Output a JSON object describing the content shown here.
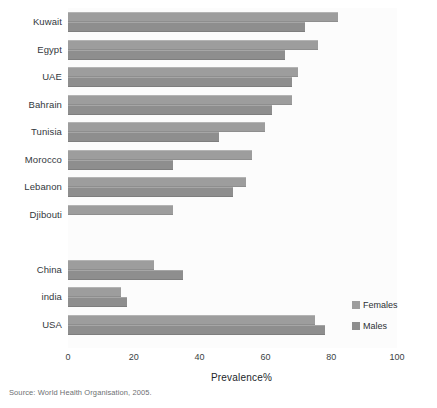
{
  "chart_data": {
    "type": "bar",
    "orientation": "horizontal",
    "title": "",
    "xlabel": "Prevalence%",
    "ylabel": "",
    "xlim": [
      0,
      100
    ],
    "xticks": [
      0,
      20,
      40,
      60,
      80,
      100
    ],
    "grid": false,
    "legend_position": "right",
    "categories": [
      "Kuwait",
      "Egypt",
      "UAE",
      "Bahrain",
      "Tunisia",
      "Morocco",
      "Lebanon",
      "Djibouti",
      "",
      "China",
      "india",
      "USA"
    ],
    "series": [
      {
        "name": "Females",
        "color": "#9d9d9d",
        "values": [
          82,
          76,
          70,
          68,
          60,
          56,
          54,
          32,
          null,
          26,
          16,
          75
        ]
      },
      {
        "name": "Males",
        "color": "#8e8e8e",
        "values": [
          72,
          66,
          68,
          62,
          46,
          32,
          50,
          null,
          null,
          35,
          18,
          78
        ]
      }
    ],
    "source": "Source: World Health Organisation, 2005."
  },
  "axis": {
    "x_title": "Prevalence%",
    "tick_labels": [
      "0",
      "20",
      "40",
      "60",
      "80",
      "100"
    ]
  },
  "legend": {
    "entries": [
      {
        "label": "Females",
        "color": "#9d9d9d"
      },
      {
        "label": "Males",
        "color": "#8e8e8e"
      }
    ]
  },
  "footer": {
    "source": "Source: World Health Organisation, 2005."
  }
}
